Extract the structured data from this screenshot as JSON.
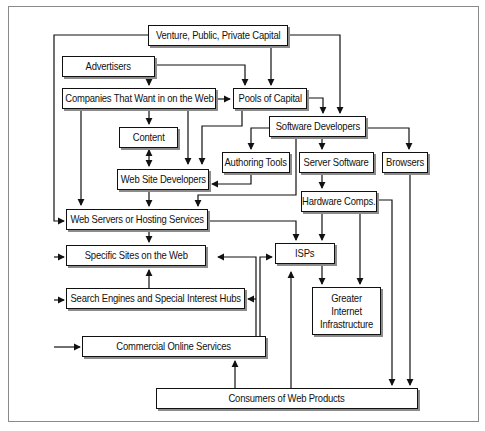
{
  "diagram": {
    "type": "flowchart",
    "colors": {
      "line": "#111111",
      "shadow": "#8c8c8c",
      "frame": "#8a8a8a",
      "background": "#ffffff"
    },
    "nodes": {
      "capital": {
        "label": "Venture, Public, Private Capital"
      },
      "advertisers": {
        "label": "Advertisers"
      },
      "companies": {
        "label": "Companies That Want in on the Web"
      },
      "pools": {
        "label": "Pools of Capital"
      },
      "software_devs": {
        "label": "Software Developers"
      },
      "content": {
        "label": "Content"
      },
      "authoring": {
        "label": "Authoring Tools"
      },
      "server_sw": {
        "label": "Server Software"
      },
      "browsers": {
        "label": "Browsers"
      },
      "site_devs": {
        "label": "Web Site Developers"
      },
      "hardware": {
        "label": "Hardware Comps."
      },
      "hosting": {
        "label": "Web Servers or Hosting Services"
      },
      "isps": {
        "label": "ISPs"
      },
      "sites": {
        "label": "Specific Sites on the Web"
      },
      "infrastructure": {
        "label": "Greater Internet Infrastructure"
      },
      "search": {
        "label": "Search Engines and Special Interest Hubs"
      },
      "commercial": {
        "label": "Commercial Online Services"
      },
      "consumers": {
        "label": "Consumers of Web Products"
      }
    },
    "edges": [
      {
        "from": "Venture, Public, Private Capital",
        "to": "Pools of Capital"
      },
      {
        "from": "Venture, Public, Private Capital",
        "to": "Software Developers"
      },
      {
        "from": "Venture, Public, Private Capital",
        "to": "Web Servers or Hosting Services"
      },
      {
        "from": "Venture, Public, Private Capital",
        "to": "Specific Sites on the Web"
      },
      {
        "from": "Venture, Public, Private Capital",
        "to": "Search Engines and Special Interest Hubs"
      },
      {
        "from": "Venture, Public, Private Capital",
        "to": "Commercial Online Services"
      },
      {
        "from": "Advertisers",
        "to": "Companies That Want in on the Web"
      },
      {
        "from": "Advertisers",
        "to": "Pools of Capital"
      },
      {
        "from": "Companies That Want in on the Web",
        "to": "Pools of Capital"
      },
      {
        "from": "Companies That Want in on the Web",
        "to": "Content"
      },
      {
        "from": "Companies That Want in on the Web",
        "to": "Web Site Developers"
      },
      {
        "from": "Companies That Want in on the Web",
        "to": "Web Servers or Hosting Services"
      },
      {
        "from": "Pools of Capital",
        "to": "Software Developers"
      },
      {
        "from": "Pools of Capital",
        "to": "Web Site Developers"
      },
      {
        "from": "Content",
        "to": "Web Site Developers",
        "bidirectional": true
      },
      {
        "from": "Software Developers",
        "to": "Authoring Tools"
      },
      {
        "from": "Software Developers",
        "to": "Server Software"
      },
      {
        "from": "Software Developers",
        "to": "Browsers"
      },
      {
        "from": "Software Developers",
        "to": "Web Servers or Hosting Services"
      },
      {
        "from": "Authoring Tools",
        "to": "Web Site Developers"
      },
      {
        "from": "Server Software",
        "to": "Hardware Comps."
      },
      {
        "from": "Web Site Developers",
        "to": "Web Servers or Hosting Services"
      },
      {
        "from": "Web Servers or Hosting Services",
        "to": "Specific Sites on the Web"
      },
      {
        "from": "Web Servers or Hosting Services",
        "to": "ISPs"
      },
      {
        "from": "Hardware Comps.",
        "to": "ISPs"
      },
      {
        "from": "Hardware Comps.",
        "to": "Greater Internet Infrastructure"
      },
      {
        "from": "Hardware Comps.",
        "to": "Consumers of Web Products"
      },
      {
        "from": "Browsers",
        "to": "Consumers of Web Products"
      },
      {
        "from": "ISPs",
        "to": "Greater Internet Infrastructure"
      },
      {
        "from": "Search Engines and Special Interest Hubs",
        "to": "Specific Sites on the Web"
      },
      {
        "from": "Commercial Online Services",
        "to": "Specific Sites on the Web"
      },
      {
        "from": "Commercial Online Services",
        "to": "Search Engines and Special Interest Hubs"
      },
      {
        "from": "Commercial Online Services",
        "to": "ISPs"
      },
      {
        "from": "Consumers of Web Products",
        "to": "Commercial Online Services"
      },
      {
        "from": "Consumers of Web Products",
        "to": "ISPs"
      }
    ]
  }
}
